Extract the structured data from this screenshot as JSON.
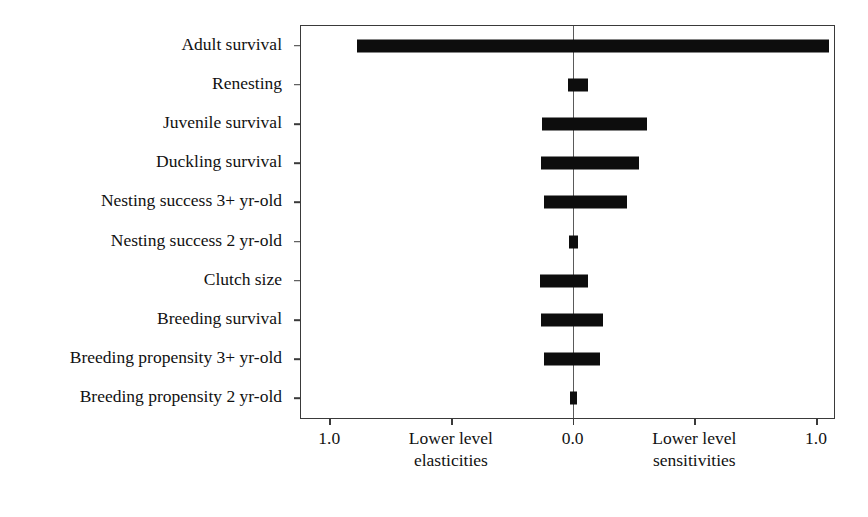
{
  "chart_data": {
    "type": "bar",
    "title": "",
    "subtitle": "",
    "xlabel": "",
    "ylabel": "",
    "orientation": "horizontal",
    "grid": false,
    "legend": null,
    "axis": {
      "x_min": -1.12,
      "x_max": 1.07,
      "zero_at": 0.0,
      "x_ticks": [
        {
          "value": -1.0,
          "label": "1.0"
        },
        {
          "value": -0.5,
          "label": ""
        },
        {
          "value": 0.0,
          "label": "0.0"
        },
        {
          "value": 0.5,
          "label": ""
        },
        {
          "value": 1.0,
          "label": "1.0"
        }
      ],
      "left_group_label_line1": "Lower level",
      "left_group_label_line2": "elasticities",
      "right_group_label_line1": "Lower level",
      "right_group_label_line2": "sensitivities"
    },
    "categories": [
      "Adult survival",
      "Renesting",
      "Juvenile survival",
      "Duckling survival",
      "Nesting success 3+ yr-old",
      "Nesting success 2 yr-old",
      "Clutch size",
      "Breeding survival",
      "Breeding propensity 3+ yr-old",
      "Breeding propensity 2 yr-old"
    ],
    "series": [
      {
        "name": "Lower level elasticities",
        "note": "magnitude plotted to the left of 0.0",
        "values": [
          0.89,
          0.025,
          0.13,
          0.135,
          0.12,
          0.02,
          0.14,
          0.135,
          0.12,
          0.015
        ]
      },
      {
        "name": "Lower level sensitivities",
        "note": "magnitude plotted to the right of 0.0",
        "values": [
          1.05,
          0.06,
          0.3,
          0.27,
          0.22,
          0.02,
          0.06,
          0.12,
          0.11,
          0.015
        ]
      }
    ],
    "bars": [
      {
        "category": "Adult survival",
        "left": -0.89,
        "right": 1.05
      },
      {
        "category": "Renesting",
        "left": -0.025,
        "right": 0.06
      },
      {
        "category": "Juvenile survival",
        "left": -0.13,
        "right": 0.3
      },
      {
        "category": "Duckling survival",
        "left": -0.135,
        "right": 0.27
      },
      {
        "category": "Nesting success 3+ yr-old",
        "left": -0.12,
        "right": 0.22
      },
      {
        "category": "Nesting success 2 yr-old",
        "left": -0.02,
        "right": 0.02
      },
      {
        "category": "Clutch size",
        "left": -0.14,
        "right": 0.06
      },
      {
        "category": "Breeding survival",
        "left": -0.135,
        "right": 0.12
      },
      {
        "category": "Breeding propensity 3+ yr-old",
        "left": -0.12,
        "right": 0.11
      },
      {
        "category": "Breeding propensity 2 yr-old",
        "left": -0.015,
        "right": 0.015
      }
    ],
    "colors": {
      "bar": "#0d0d0d",
      "frame": "#3a3a3a",
      "zero_line": "#5a5a5a",
      "background": "#ffffff",
      "text": "#111111"
    }
  }
}
